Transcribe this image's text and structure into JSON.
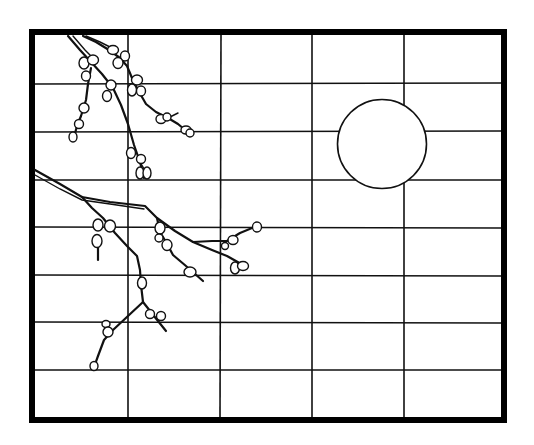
{
  "scene": {
    "title": "",
    "description": "Line-art illustration of a shoji screen with a budding branch and a full moon",
    "colors": {
      "background": "#ffffff",
      "ink": "#111111"
    }
  },
  "frame": {
    "x": 32,
    "y": 32,
    "width": 472,
    "height": 388
  },
  "grid": {
    "verticals": [
      128,
      221,
      312,
      404
    ],
    "horizontals": [
      83,
      131,
      180,
      227,
      275,
      322,
      370
    ]
  },
  "moon": {
    "cx": 382,
    "cy": 144,
    "r": 44.5
  }
}
